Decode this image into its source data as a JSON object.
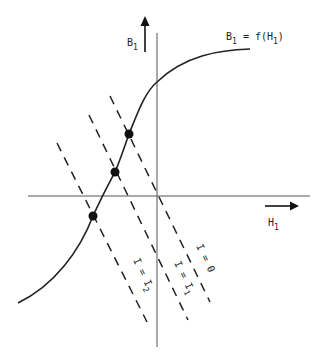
{
  "diagram": {
    "axes": {
      "y_label": "B",
      "y_label_sub": "1",
      "x_label": "H",
      "x_label_sub": "1"
    },
    "curve": {
      "label_lhs": "B",
      "label_lhs_sub": "1",
      "label_rhs_pre": " = f(H",
      "label_rhs_sub": "1",
      "label_rhs_post": ")"
    },
    "load_lines": [
      {
        "label_pre": "I = 0",
        "label_sub": ""
      },
      {
        "label_pre": "I = I",
        "label_sub": "1"
      },
      {
        "label_pre": "I = I",
        "label_sub": "2"
      }
    ],
    "operating_points": 3,
    "colors": {
      "line": "#222222",
      "axis": "#555555",
      "background": "#ffffff"
    }
  }
}
